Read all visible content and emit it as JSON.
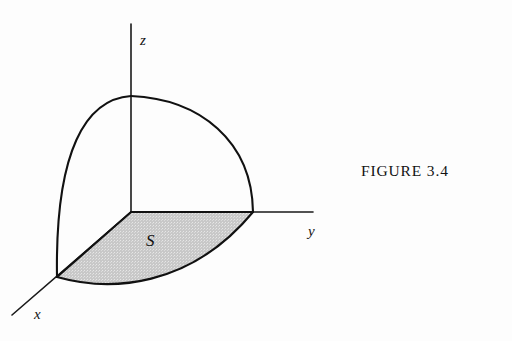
{
  "figure": {
    "caption": "FIGURE 3.4",
    "background_color": "#fdfdfd",
    "line_color": "#111111",
    "shaded_region_color": "#c8c8c8",
    "axes": {
      "x_label": "x",
      "y_label": "y",
      "z_label": "z"
    },
    "region_label": "S"
  }
}
